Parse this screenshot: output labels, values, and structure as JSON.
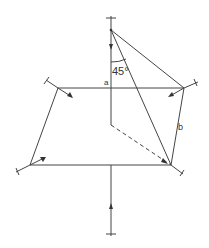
{
  "diagram": {
    "labels": {
      "angle": "45°",
      "point_a": "a",
      "point_b": "b"
    },
    "colors": {
      "stroke": "#444444",
      "background": "#ffffff"
    }
  }
}
